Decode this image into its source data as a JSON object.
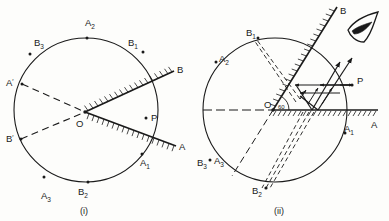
{
  "figure": {
    "background_color": "#fdfdfb",
    "ink_color": "#1a1a1a",
    "panels": [
      {
        "id": "i",
        "caption": "(i)",
        "center_label": "O",
        "mirror_labels": [
          "A",
          "B"
        ],
        "object_label": "P",
        "image_labels": [
          "A1",
          "A2",
          "A3",
          "B1",
          "B2",
          "B3"
        ],
        "construction_labels": [
          "A'",
          "B'"
        ],
        "labels": [
          {
            "text": "A",
            "sub": "2",
            "x": 85,
            "y": 26
          },
          {
            "text": "B",
            "sub": "3",
            "x": 34,
            "y": 46
          },
          {
            "text": "B",
            "sub": "1",
            "x": 128,
            "y": 46
          },
          {
            "text": "A",
            "sub": "'",
            "x": 10,
            "y": 86
          },
          {
            "text": "B",
            "sub": "'",
            "x": 10,
            "y": 139
          },
          {
            "text": "O",
            "sub": "",
            "x": 78,
            "y": 124
          },
          {
            "text": "P",
            "sub": "",
            "x": 152,
            "y": 122
          },
          {
            "text": "B",
            "sub": "",
            "x": 178,
            "y": 73
          },
          {
            "text": "A",
            "sub": "",
            "x": 180,
            "y": 148
          },
          {
            "text": "A",
            "sub": "1",
            "x": 143,
            "y": 163
          },
          {
            "text": "B",
            "sub": "2",
            "x": 79,
            "y": 193
          },
          {
            "text": "A",
            "sub": "3",
            "x": 43,
            "y": 196
          }
        ]
      },
      {
        "id": "ii",
        "caption": "(ii)",
        "center_label": "O",
        "angle_label": "60",
        "mirror_labels": [
          "A",
          "B"
        ],
        "object_label": "P",
        "image_labels": [
          "A1",
          "A2",
          "A3",
          "B1",
          "B2",
          "B3"
        ],
        "eye_symbol": "observer-eye",
        "labels": [
          {
            "text": "B",
            "sub": "1",
            "x": 248,
            "y": 35
          },
          {
            "text": "A",
            "sub": "2",
            "x": 220,
            "y": 58
          },
          {
            "text": "B",
            "sub": "",
            "x": 340,
            "y": 12
          },
          {
            "text": "P",
            "sub": "",
            "x": 356,
            "y": 82
          },
          {
            "text": "O",
            "sub": "",
            "x": 270,
            "y": 106
          },
          {
            "text": "A",
            "sub": "",
            "x": 374,
            "y": 126
          },
          {
            "text": "A",
            "sub": "1",
            "x": 348,
            "y": 138
          },
          {
            "text": "B",
            "sub": "3",
            "x": 200,
            "y": 165
          },
          {
            "text": "A",
            "sub": "3",
            "x": 219,
            "y": 163
          },
          {
            "text": "B",
            "sub": "2",
            "x": 253,
            "y": 193
          }
        ]
      }
    ]
  }
}
